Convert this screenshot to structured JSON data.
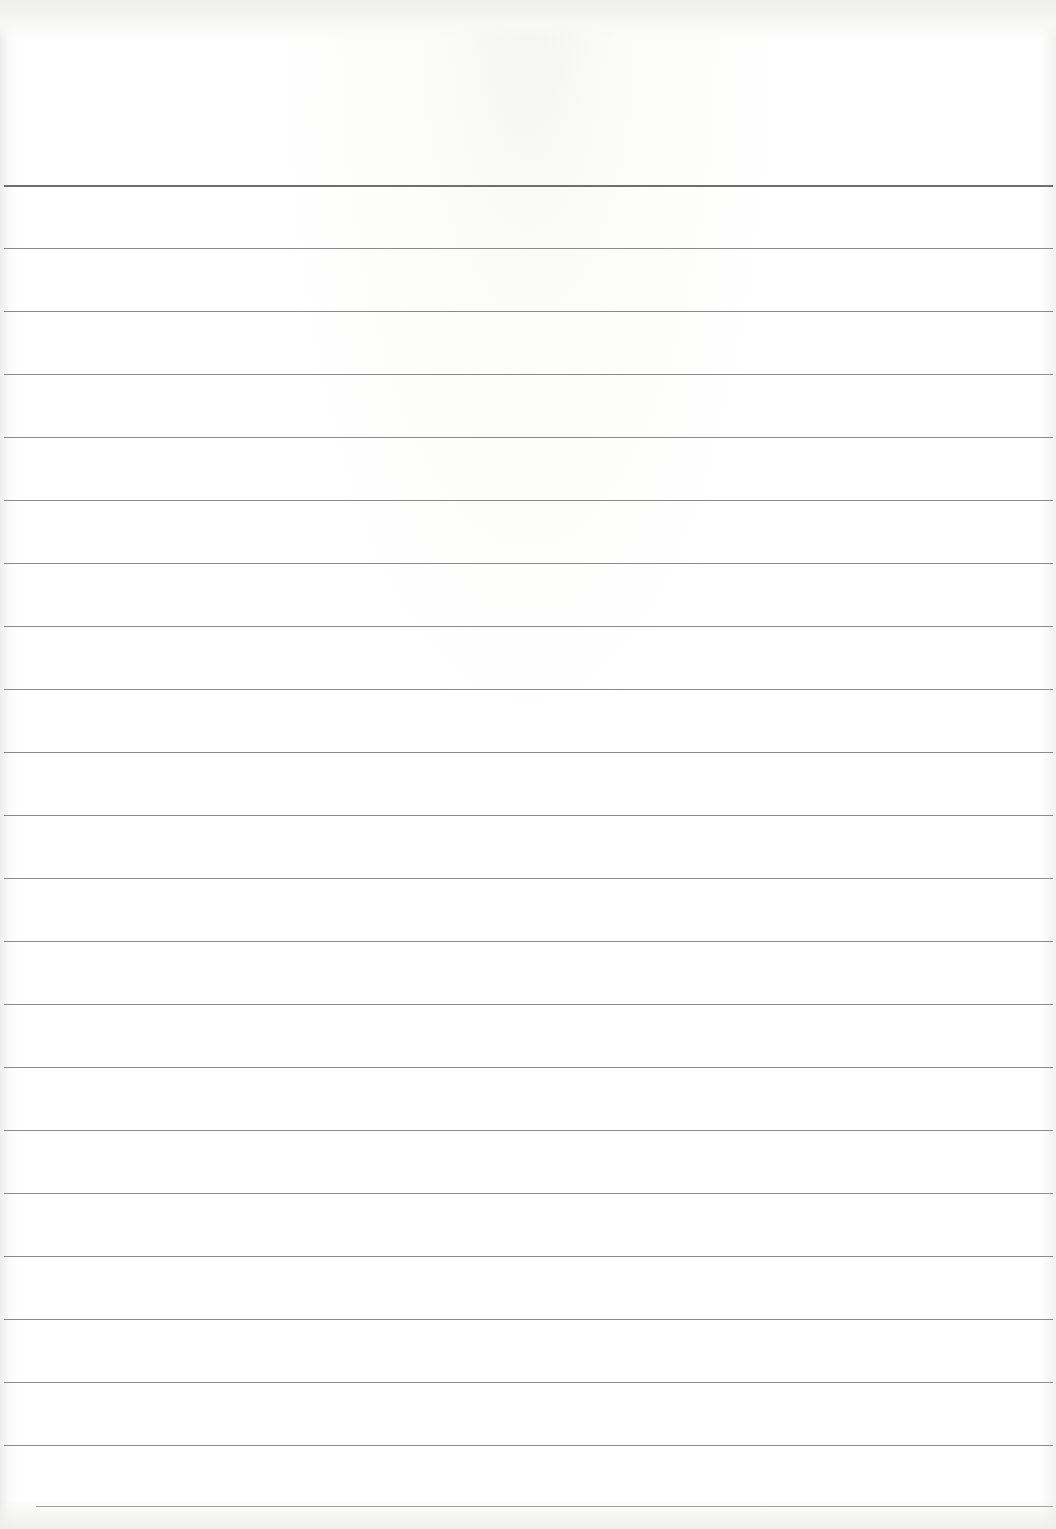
{
  "page": {
    "type": "lined-paper",
    "background_color": "#ffffff",
    "line_color": "#8a8a8a",
    "header_line_color": "#6e6e6e",
    "header_line_y": 185,
    "line_spacing": 63,
    "rule_lines_y": [
      248,
      311,
      374,
      437,
      500,
      563,
      626,
      689,
      752,
      815,
      878,
      941,
      1004,
      1067,
      1130,
      1193,
      1256,
      1319,
      1382,
      1445
    ],
    "bottom_line": {
      "y": 1506,
      "x_start": 36
    }
  }
}
